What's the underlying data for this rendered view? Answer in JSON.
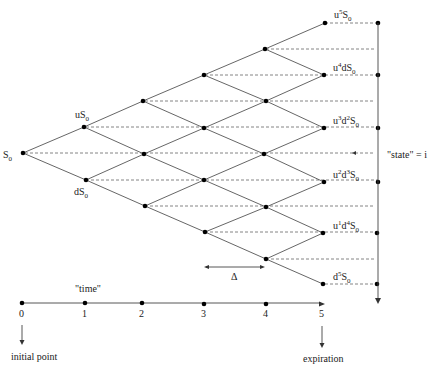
{
  "diagram": {
    "steps": 5,
    "node_labels": {
      "root": {
        "base": "S",
        "sub": "0"
      },
      "t1_up": {
        "pre": "u",
        "base": "S",
        "sub": "0"
      },
      "t1_down": {
        "pre": "d",
        "base": "S",
        "sub": "0"
      },
      "terminal": [
        {
          "text": "u",
          "sup1": "5",
          "mid": "",
          "sup2": "",
          "base": "S",
          "sub": "0"
        },
        {
          "text": "u",
          "sup1": "4",
          "mid": "d",
          "sup2": "",
          "base": "S",
          "sub": "0"
        },
        {
          "text": "u",
          "sup1": "3",
          "mid": "d",
          "sup2": "2",
          "base": "S",
          "sub": "0"
        },
        {
          "text": "u",
          "sup1": "2",
          "mid": "d",
          "sup2": "3",
          "base": "S",
          "sub": "0"
        },
        {
          "text": "u",
          "sup1": "1",
          "mid": "d",
          "sup2": "4",
          "base": "S",
          "sub": "0"
        },
        {
          "text": "d",
          "sup1": "5",
          "mid": "",
          "sup2": "",
          "base": "S",
          "sub": "0"
        }
      ]
    },
    "state_label": "\"state\" = i",
    "delta_label": "Δ",
    "time_axis": {
      "label": "\"time\"",
      "ticks": [
        "0",
        "1",
        "2",
        "3",
        "4",
        "5"
      ],
      "start_annotation": "initial point",
      "end_annotation": "expiration"
    },
    "colors": {
      "line": "#555555",
      "dashed": "#666666",
      "node": "#000000",
      "text": "#222222"
    }
  }
}
